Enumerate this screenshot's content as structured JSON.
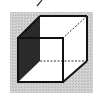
{
  "figure": {
    "type": "wireframe-cube",
    "colors": {
      "background": "#ffffff",
      "panel": "#c8c8c8",
      "shade": "#2a2a2a",
      "edge": "#111111",
      "face": "#ffffff"
    }
  }
}
